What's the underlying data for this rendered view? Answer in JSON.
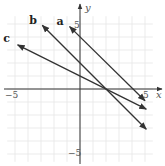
{
  "chart_data": {
    "type": "line",
    "title": "",
    "xlabel": "x",
    "ylabel": "y",
    "xlim": [
      -5,
      5
    ],
    "ylim": [
      -5,
      5
    ],
    "grid": true,
    "tick_labels": {
      "x_min": "−5",
      "x_max": "5",
      "y_min": "−5",
      "y_max": "5"
    },
    "series": [
      {
        "name": "a",
        "x": [
          -0.8,
          5
        ],
        "y": [
          4.8,
          -0.9
        ],
        "equation": "y = -x + 4"
      },
      {
        "name": "b",
        "x": [
          -2.9,
          5.1
        ],
        "y": [
          4.9,
          -3.1
        ],
        "equation": "y = -x + 2"
      },
      {
        "name": "c",
        "x": [
          -4.8,
          5.1
        ],
        "y": [
          3.4,
          -1.55
        ],
        "equation": "y = -0.5x + 1"
      }
    ]
  }
}
